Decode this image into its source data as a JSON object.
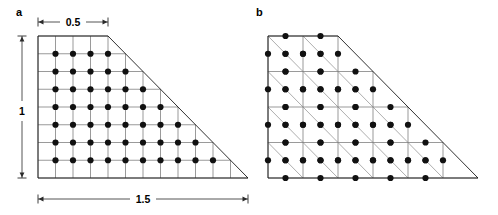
{
  "figure": {
    "panels": [
      {
        "id": "a",
        "label": "a",
        "label_x": 16,
        "label_y": 16,
        "mesh_type": "quadrilateral",
        "geometry": {
          "origin_x": 38,
          "origin_y": 36,
          "cell_w": 17.5,
          "cell_h": 17.75,
          "cols": 12,
          "rows": 8,
          "top_edge_cols": 4,
          "hypotenuse": {
            "x1": 108,
            "y1": 36,
            "x2": 248,
            "y2": 178
          }
        },
        "dot_rows": [
          4,
          5,
          6,
          7,
          8,
          9,
          10
        ],
        "dot_radius": 3.1,
        "dot_count": 49,
        "dimensions": [
          {
            "name": "top-width",
            "label": "0.5",
            "orientation": "horizontal",
            "x1": 38,
            "x2": 108,
            "y": 22,
            "label_x": 73,
            "label_y": 26
          },
          {
            "name": "left-height",
            "label": "1",
            "orientation": "vertical",
            "y1": 36,
            "y2": 178,
            "x": 22,
            "label_x": 22,
            "label_y": 111
          },
          {
            "name": "bottom-width",
            "label": "1.5",
            "orientation": "horizontal",
            "x1": 38,
            "x2": 248,
            "y": 199,
            "label_x": 143,
            "label_y": 203
          }
        ]
      },
      {
        "id": "b",
        "label": "b",
        "label_x": 256,
        "label_y": 16,
        "mesh_type": "triangular",
        "geometry": {
          "origin_x": 268,
          "origin_y": 36,
          "cell_w": 35.0,
          "cell_h": 35.5,
          "cols": 6,
          "rows": 4,
          "top_edge_cols": 2,
          "hypotenuse": {
            "x1": 338,
            "y1": 36,
            "x2": 478,
            "y2": 178
          }
        },
        "points_per_triangle": 3,
        "dot_radius": 3.1,
        "dimensions": []
      }
    ]
  },
  "colors": {
    "mesh_line": "#6e6e6e",
    "mesh_diagonal": "#8a8a8a",
    "domain_edge": "#1a1a1a",
    "dot": "#111111",
    "dimension_line": "#2a2a2a",
    "background": "#ffffff"
  }
}
